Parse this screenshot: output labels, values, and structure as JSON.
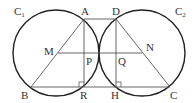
{
  "diagram": {
    "type": "geometry",
    "circles": [
      {
        "name": "C1",
        "label": "C",
        "sub": "1",
        "cx": 56,
        "cy": 53,
        "r": 43
      },
      {
        "name": "C2",
        "label": "C",
        "sub": "2",
        "cx": 142,
        "cy": 53,
        "r": 43
      }
    ],
    "points": {
      "A": {
        "label": "A",
        "x": 84,
        "y": 19
      },
      "D": {
        "label": "D",
        "x": 116,
        "y": 19
      },
      "B": {
        "label": "B",
        "x": 31,
        "y": 87
      },
      "C": {
        "label": "C",
        "x": 170,
        "y": 87
      },
      "R": {
        "label": "R",
        "x": 84,
        "y": 87
      },
      "H": {
        "label": "H",
        "x": 116,
        "y": 87
      },
      "M": {
        "label": "M",
        "x": 58,
        "y": 53
      },
      "N": {
        "label": "N",
        "x": 142,
        "y": 53
      },
      "P": {
        "label": "P",
        "x": 84,
        "y": 53
      },
      "Q": {
        "label": "Q",
        "x": 116,
        "y": 53
      }
    },
    "segments": [
      "AD",
      "AB",
      "DC",
      "AR",
      "DH",
      "BC",
      "MN"
    ],
    "right_angles": [
      "R",
      "H"
    ],
    "line_color": "#555555",
    "circle_color": "#222222"
  }
}
